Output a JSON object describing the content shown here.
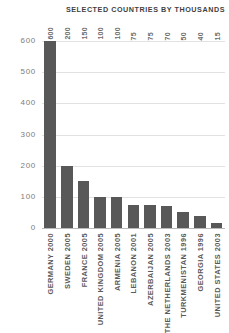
{
  "chart_data": {
    "type": "bar",
    "title": "SELECTED COUNTRIES BY THOUSANDS",
    "xlabel": "",
    "ylabel": "",
    "ylim": [
      0,
      600
    ],
    "yticks": [
      0,
      100,
      200,
      300,
      400,
      500,
      600
    ],
    "ytick_labels": [
      "0",
      "100",
      "200",
      "300",
      "400",
      "500",
      "600"
    ],
    "grid": true,
    "legend": "none",
    "bar_color": "#585858",
    "grid_color": "#e2e2e2",
    "axis_color": "#b9b9b9",
    "categories": [
      "GERMANY 2000",
      "SWEDEN 2005",
      "FRANCE 2005",
      "UNITED KINGDOM 2005",
      "ARMENIA 2005",
      "LEBANON 2001",
      "AZERBAIJAN 2005",
      "THE NETHERLANDS 2003",
      "TURKMENISTAN 1996",
      "GEORGIA 1996",
      "UNITED STATES 2003"
    ],
    "values": [
      600,
      200,
      150,
      100,
      100,
      75,
      75,
      70,
      50,
      40,
      15
    ],
    "value_labels": [
      "600",
      "200",
      "150",
      "100",
      "100",
      "75",
      "75",
      "70",
      "50",
      "40",
      "15"
    ]
  }
}
